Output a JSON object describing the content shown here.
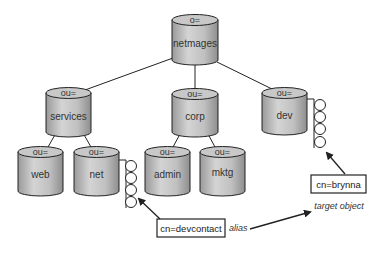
{
  "diagram": {
    "title": "",
    "nodes": {
      "root": {
        "type_label": "o=",
        "name": "netmages"
      },
      "services": {
        "type_label": "ou=",
        "name": "services"
      },
      "corp": {
        "type_label": "ou=",
        "name": "corp"
      },
      "dev": {
        "type_label": "ou=",
        "name": "dev"
      },
      "web": {
        "type_label": "ou=",
        "name": "web"
      },
      "net": {
        "type_label": "ou=",
        "name": "net"
      },
      "admin": {
        "type_label": "ou=",
        "name": "admin"
      },
      "mktg": {
        "type_label": "ou=",
        "name": "mktg"
      }
    },
    "entries": {
      "alias_entry": {
        "label": "cn=devcontact",
        "annotation": "alias"
      },
      "target_entry": {
        "label": "cn=brynna",
        "annotation": "target object"
      }
    },
    "edges": [
      [
        "root",
        "services"
      ],
      [
        "root",
        "corp"
      ],
      [
        "root",
        "dev"
      ],
      [
        "services",
        "web"
      ],
      [
        "services",
        "net"
      ],
      [
        "corp",
        "admin"
      ],
      [
        "corp",
        "mktg"
      ]
    ],
    "colors": {
      "cylinder_body": "#b8b8b8",
      "cylinder_top": "#c8c8c8",
      "stroke": "#222222",
      "background": "#ffffff"
    }
  }
}
